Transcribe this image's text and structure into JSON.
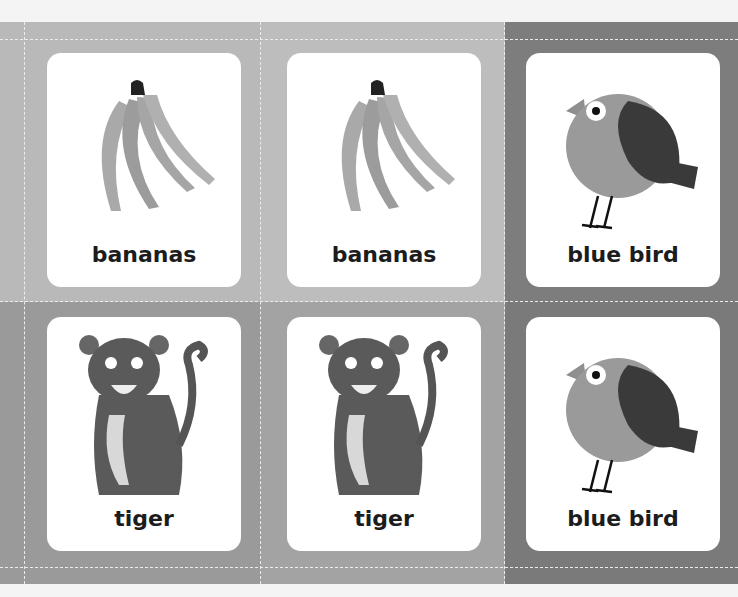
{
  "cards": [
    {
      "label": "bananas",
      "icon": "bananas-icon"
    },
    {
      "label": "bananas",
      "icon": "bananas-icon"
    },
    {
      "label": "blue bird",
      "icon": "bird-icon"
    },
    {
      "label": "tiger",
      "icon": "tiger-icon"
    },
    {
      "label": "tiger",
      "icon": "tiger-icon"
    },
    {
      "label": "blue bird",
      "icon": "bird-icon"
    }
  ],
  "colors": {
    "card_bg": "#ffffff",
    "label_text": "#1c1c1c",
    "panel_light": "#bdbdbd",
    "panel_mid": "#9a9a9a",
    "panel_dark": "#7a7a7a",
    "cut_line": "#ececec"
  }
}
